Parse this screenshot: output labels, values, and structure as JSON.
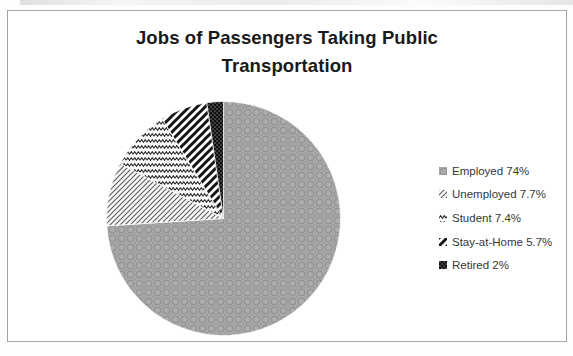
{
  "title": "Jobs of Passengers Taking Public Transportation",
  "frame": {
    "border_color": "#a3a3a3",
    "background": "#ffffff"
  },
  "chart_data": {
    "type": "pie",
    "title": "Jobs of Passengers Taking Public Transportation",
    "categories": [
      "Employed",
      "Unemployed",
      "Student",
      "Stay-at-Home",
      "Retired"
    ],
    "values": [
      74,
      7.7,
      7.4,
      5.7,
      2
    ],
    "value_unit": "%",
    "legend_entries": [
      "Employed 74%",
      "Unemployed 7.7%",
      "Student 7.4%",
      "Stay-at-Home 5.7%",
      "Retired 2%"
    ],
    "legend_position": "right",
    "start_angle_deg": 0,
    "direction": "clockwise",
    "slice_angles_deg": [
      266.4,
      31.6,
      30.4,
      23.4,
      8.2
    ],
    "patterns": [
      "gray-weave",
      "thin-diagonal-stripes",
      "zigzag-waves",
      "bold-diagonal-stripes",
      "black-dotted"
    ],
    "monochrome": true,
    "pattern_colors": {
      "gray_base": "#a9a9a9",
      "gray_ring": "#8e8e8e",
      "stripe_thin": "#5a5a5a",
      "zigzag": "#2b2b2b",
      "stripe_bold": "#151515",
      "black_fill": "#111111",
      "pattern_background": "#fafafa"
    }
  }
}
